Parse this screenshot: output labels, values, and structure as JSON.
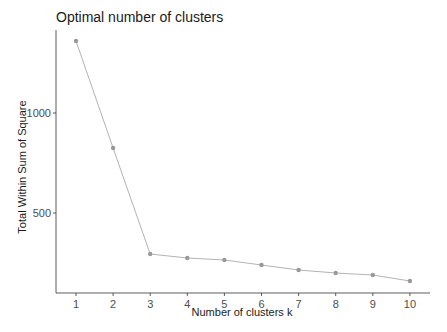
{
  "chart_data": {
    "type": "line",
    "title": "Optimal number of clusters",
    "xlabel": "Number of clusters k",
    "ylabel": "Total Within Sum of Square",
    "x": [
      1,
      2,
      3,
      4,
      5,
      6,
      7,
      8,
      9,
      10
    ],
    "categories": [
      "1",
      "2",
      "3",
      "4",
      "5",
      "6",
      "7",
      "8",
      "9",
      "10"
    ],
    "series": [
      {
        "name": "wss",
        "values": [
          1360,
          825,
          295,
          275,
          265,
          240,
          215,
          200,
          190,
          160
        ],
        "color": "#999999"
      }
    ],
    "yticks": [
      500,
      1000
    ],
    "ytick_labels": [
      "500",
      "1000"
    ],
    "ylim": [
      60,
      1450
    ],
    "grid": false,
    "legend": "none"
  },
  "colors": {
    "line": "#b3b3b3",
    "point": "#999999",
    "axis": "#333333"
  }
}
